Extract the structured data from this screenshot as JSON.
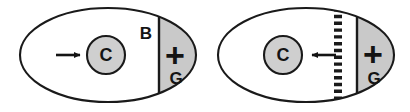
{
  "figure": {
    "background_color": "#ffffff",
    "outline_color": "#1a1a1a",
    "shaded_fill": "#c9c9c9",
    "core_fill": "#cfcfcf",
    "panels": [
      {
        "id": "panel-left",
        "ellipse": {
          "cx": 108,
          "cy": 55,
          "rx": 88,
          "ry": 47
        },
        "core": {
          "label": "C",
          "cx": 106,
          "cy": 55,
          "r": 19
        },
        "boundary": {
          "label": "B",
          "style": "solid",
          "x": 159,
          "label_x": 146,
          "label_y": 33
        },
        "shaded_region": {
          "plus_label": "+",
          "plus_x": 175,
          "plus_y": 55,
          "gas_label": "G",
          "gas_x": 176,
          "gas_y": 78
        },
        "arrow": {
          "direction": "right",
          "from_x": 56,
          "to_x": 86,
          "y": 55
        }
      },
      {
        "id": "panel-right",
        "ellipse": {
          "cx": 306,
          "cy": 55,
          "rx": 88,
          "ry": 47
        },
        "core": {
          "label": "C",
          "cx": 283,
          "cy": 55,
          "r": 19
        },
        "boundary": {
          "label": "",
          "style": "solid",
          "x": 357,
          "label_x": 0,
          "label_y": 0
        },
        "dashed_boundary": {
          "style": "dashed",
          "x": 338,
          "tick_count": 14
        },
        "shaded_region": {
          "plus_label": "+",
          "plus_x": 373,
          "plus_y": 54,
          "gas_label": "G",
          "gas_x": 374,
          "gas_y": 78
        },
        "arrow": {
          "direction": "left",
          "from_x": 336,
          "to_x": 306,
          "y": 55
        }
      }
    ]
  }
}
